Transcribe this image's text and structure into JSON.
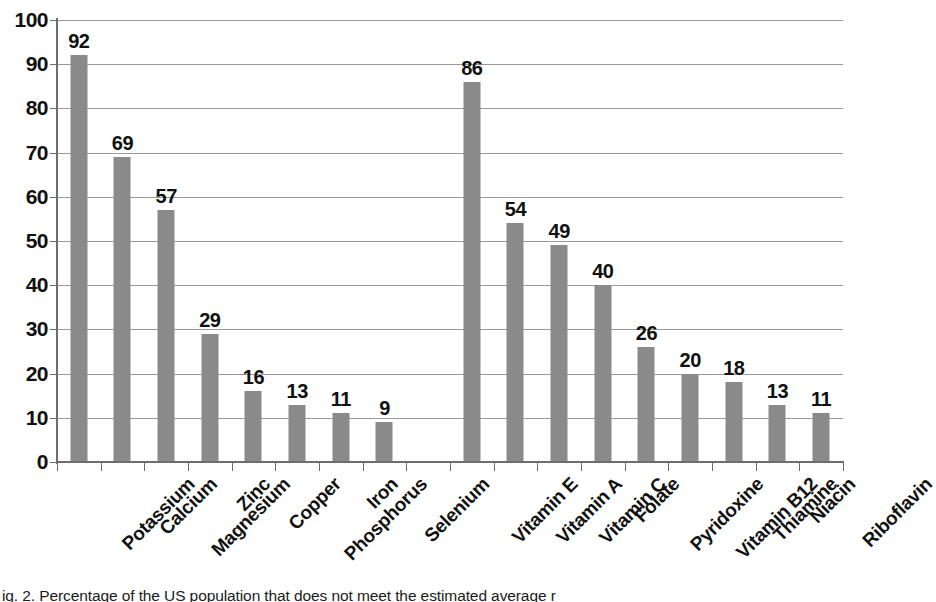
{
  "figure": {
    "caption": "ig. 2. Percentage of the US population that does not meet the estimated average r"
  },
  "chart_data": {
    "type": "bar",
    "title": "",
    "subtitle": "",
    "xlabel": "",
    "ylabel": "",
    "ylim": [
      0,
      100
    ],
    "ytick_step": 10,
    "ytick_labels": [
      "100",
      "90",
      "80",
      "70",
      "60",
      "50",
      "40",
      "30",
      "20",
      "10",
      "0"
    ],
    "grid": true,
    "legend": "none",
    "bar_color": "#8a8a8a",
    "axis_color": "#6d6d6d",
    "gridline_color": "#9a9a9a",
    "label_color": "#111111",
    "categories": [
      "Potassium",
      "Calcium",
      "Magnesium",
      "Zinc",
      "Copper",
      "Phosphorus",
      "Iron",
      "Selenium",
      "",
      "Vitamin E",
      "Vitamin A",
      "Vitamin C",
      "Folate",
      "Pyridoxine",
      "Vitamin B12",
      "Thiamine",
      "Niacin",
      "Riboflavin"
    ],
    "values": [
      92,
      69,
      57,
      29,
      16,
      13,
      11,
      9,
      null,
      86,
      54,
      49,
      40,
      26,
      20,
      18,
      13,
      11
    ],
    "value_labels": [
      "92",
      "69",
      "57",
      "29",
      "16",
      "13",
      "11",
      "9",
      "",
      "86",
      "54",
      "49",
      "40",
      "26",
      "20",
      "18",
      "13",
      "11"
    ],
    "groups": [
      {
        "name": "Minerals",
        "categories": [
          "Potassium",
          "Calcium",
          "Magnesium",
          "Zinc",
          "Copper",
          "Phosphorus",
          "Iron",
          "Selenium"
        ],
        "values": [
          92,
          69,
          57,
          29,
          16,
          13,
          11,
          9
        ]
      },
      {
        "name": "Vitamins",
        "categories": [
          "Vitamin E",
          "Vitamin A",
          "Vitamin C",
          "Folate",
          "Pyridoxine",
          "Vitamin B12",
          "Thiamine",
          "Niacin",
          "Riboflavin"
        ],
        "values": [
          86,
          54,
          49,
          40,
          26,
          20,
          18,
          13,
          11
        ]
      }
    ]
  }
}
